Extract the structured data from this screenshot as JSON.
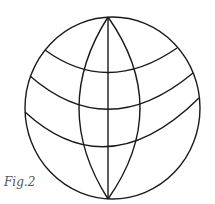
{
  "figure": {
    "caption": "Fig.2",
    "stroke_color": "#1a1a1a"
  }
}
